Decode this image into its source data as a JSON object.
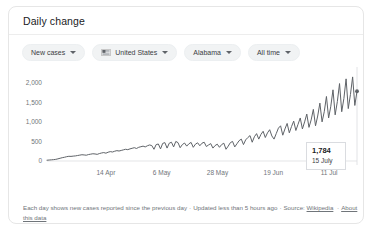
{
  "card": {
    "title": "Daily change"
  },
  "filters": [
    {
      "label": "New cases",
      "icon": "chevron-down-icon",
      "name": "metric"
    },
    {
      "label": "United States",
      "icon": "us-flag-icon",
      "name": "country"
    },
    {
      "label": "Alabama",
      "icon": "chevron-down-icon",
      "name": "region"
    },
    {
      "label": "All time",
      "icon": "chevron-down-icon",
      "name": "time-range"
    }
  ],
  "tooltip": {
    "value": "1,784",
    "date": "15 July"
  },
  "footer": {
    "text": "Each day shows new cases reported since the previous day",
    "separator": "·",
    "updated": "Updated less than 5 hours ago",
    "source_label": "Source:",
    "source_link": "Wikipedia",
    "about_link": "About this data"
  },
  "colors": {
    "line": "#5f6368",
    "chip_bg": "#f1f3f4",
    "axis_text": "#70757a",
    "grid": "#e8eaed",
    "card_border": "#e6e6e6"
  },
  "chart_data": {
    "type": "line",
    "title": "Daily change",
    "xlabel": "",
    "ylabel": "",
    "ylim": [
      0,
      2250
    ],
    "yticks": [
      0,
      500,
      1000,
      1500,
      2000
    ],
    "ytick_labels": [
      "0",
      "500",
      "1,000",
      "1,500",
      "2,000"
    ],
    "xticks": [
      "14 Apr",
      "6 May",
      "28 May",
      "19 Jun",
      "11 Jul"
    ],
    "xtick_positions": [
      0.19,
      0.37,
      0.55,
      0.73,
      0.91
    ],
    "grid": false,
    "legend": null,
    "annotation": {
      "value": 1784,
      "label": "15 July"
    },
    "series": [
      {
        "name": "New cases",
        "values": [
          20,
          25,
          30,
          35,
          42,
          55,
          70,
          85,
          95,
          110,
          120,
          118,
          125,
          130,
          140,
          150,
          160,
          155,
          148,
          165,
          175,
          185,
          180,
          170,
          190,
          205,
          215,
          200,
          225,
          240,
          230,
          250,
          265,
          255,
          270,
          285,
          300,
          290,
          310,
          325,
          340,
          320,
          350,
          365,
          380,
          360,
          390,
          410,
          395,
          300,
          420,
          435,
          310,
          450,
          470,
          330,
          455,
          480,
          360,
          500,
          470,
          340,
          420,
          460,
          380,
          440,
          475,
          350,
          430,
          465,
          390,
          455,
          480,
          370,
          410,
          445,
          330,
          395,
          430,
          350,
          420,
          455,
          300,
          380,
          470,
          500,
          360,
          440,
          520,
          560,
          420,
          540,
          600,
          650,
          480,
          620,
          700,
          560,
          680,
          760,
          600,
          720,
          800,
          640,
          560,
          700,
          840,
          900,
          660,
          820,
          960,
          720,
          880,
          1020,
          780,
          940,
          1100,
          820,
          1000,
          1200,
          860,
          1050,
          1320,
          900,
          1150,
          1480,
          1000,
          1260,
          1650,
          1100,
          1400,
          1820,
          1180,
          1520,
          1980,
          1260,
          1600,
          2100,
          1340,
          1700,
          2150,
          1420,
          1784
        ]
      }
    ]
  }
}
